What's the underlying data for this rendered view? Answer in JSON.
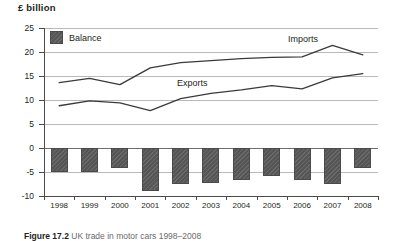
{
  "axis_title": "£ billion",
  "legend": {
    "label": "Balance",
    "swatch_color": "#565656"
  },
  "series_labels": {
    "imports": "Imports",
    "exports": "Exports"
  },
  "caption": {
    "figure_number": "Figure 17.2",
    "text": "UK trade in motor cars 1998–2008"
  },
  "colors": {
    "bar_fill": "#565656",
    "bar_stroke": "#4a4a4a",
    "line": "#3a3a3a",
    "grid": "#b9b9b9",
    "axis": "#4a4a4a",
    "text": "#231f20"
  },
  "chart_data": {
    "type": "bar",
    "title": "£ billion",
    "xlabel": "",
    "ylabel": "£ billion",
    "ylim": [
      -10,
      25
    ],
    "ytick_step": 5,
    "yticks": [
      25,
      20,
      15,
      10,
      5,
      0,
      -5,
      -10
    ],
    "ytick_labels": [
      "25",
      "20",
      "15",
      "10",
      "5",
      "0",
      "-5",
      "-10"
    ],
    "grid": true,
    "legend_position": "top-left",
    "categories": [
      "1998",
      "1999",
      "2000",
      "2001",
      "2002",
      "2003",
      "2004",
      "2005",
      "2006",
      "2007",
      "2008"
    ],
    "series": [
      {
        "name": "Imports",
        "type": "line",
        "values": [
          13.6,
          14.5,
          13.2,
          16.7,
          17.8,
          18.2,
          18.6,
          18.9,
          19.0,
          21.4,
          19.4
        ]
      },
      {
        "name": "Exports",
        "type": "line",
        "values": [
          8.8,
          9.8,
          9.4,
          7.8,
          10.3,
          11.4,
          12.1,
          13.0,
          12.3,
          14.6,
          15.5
        ]
      },
      {
        "name": "Balance",
        "type": "bar",
        "values": [
          -5.0,
          -5.0,
          -4.1,
          -8.9,
          -7.5,
          -7.3,
          -6.6,
          -5.9,
          -6.7,
          -7.4,
          -4.1
        ]
      }
    ]
  }
}
